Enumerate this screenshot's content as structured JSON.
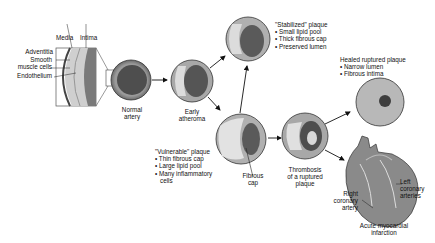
{
  "diagram": {
    "type": "pathway",
    "title": "",
    "colors": {
      "background": "#ffffff",
      "vessel_wall": "#b8b8b8",
      "lumen": "#5a5a5a",
      "plaque": "#d8d8d8",
      "arrow": "#111111"
    },
    "inset": {
      "labels": {
        "media": "Media",
        "intima": "Intima",
        "adventitia": "Adventitia",
        "smooth_muscle": "Smooth muscle cells",
        "smooth_muscle_line1": "Smooth",
        "smooth_muscle_line2": "muscle cells",
        "endothelium": "Endothelium"
      }
    },
    "nodes": {
      "normal": {
        "line1": "Normal",
        "line2": "artery"
      },
      "early": {
        "line1": "Early",
        "line2": "atheroma"
      },
      "stabilized": {
        "title": "\"Stabilized\" plaque",
        "bullets": [
          "Small lipid pool",
          "Thick fibrous cap",
          "Preserved lumen"
        ]
      },
      "vulnerable": {
        "title": "\"Vulnerable\" plaque",
        "bullets": [
          "Thin fibrous cap",
          "Large lipid pool",
          "Many inflammatory cells"
        ],
        "bullet3_line1": "Many inflammatory",
        "bullet3_line2": "cells"
      },
      "fibrous_cap": {
        "line1": "Fibrous",
        "line2": "cap"
      },
      "thrombosis": {
        "line1": "Thrombosis",
        "line2": "of a ruptured",
        "line3": "plaque"
      },
      "healed": {
        "title": "Healed ruptured plaque",
        "bullets": [
          "Narrow lumen",
          "Fibrous intima"
        ]
      },
      "heart": {
        "right_coronary": {
          "line1": "Right",
          "line2": "coronary",
          "line3": "artery"
        },
        "left_coronary": {
          "line1": "Left",
          "line2": "coronary",
          "line3": "arteries"
        },
        "infarction": {
          "line1": "Acute myocardial",
          "line2": "infarction"
        }
      }
    },
    "edges": [
      [
        "Normal artery",
        "Early atheroma"
      ],
      [
        "Early atheroma",
        "\"Stabilized\" plaque"
      ],
      [
        "Early atheroma",
        "\"Vulnerable\" plaque"
      ],
      [
        "\"Vulnerable\" plaque",
        "\"Stabilized\" plaque"
      ],
      [
        "\"Vulnerable\" plaque",
        "Thrombosis of a ruptured plaque"
      ],
      [
        "Thrombosis of a ruptured plaque",
        "Healed ruptured plaque"
      ],
      [
        "Thrombosis of a ruptured plaque",
        "Acute myocardial infarction"
      ]
    ]
  }
}
